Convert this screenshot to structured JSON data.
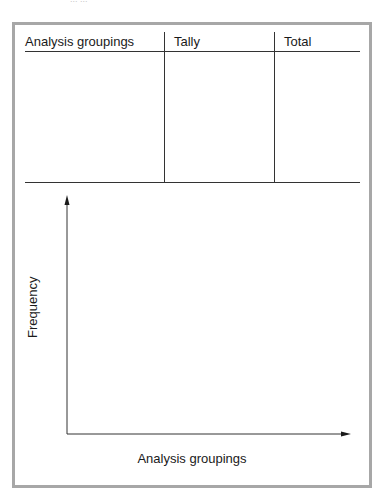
{
  "page": {
    "clipped_caption": "... ..."
  },
  "table": {
    "columns": [
      {
        "label": "Analysis groupings"
      },
      {
        "label": "Tally"
      },
      {
        "label": "Total"
      }
    ],
    "rows": []
  },
  "graph": {
    "y_axis_label": "Frequency",
    "x_axis_label": "Analysis groupings"
  },
  "colors": {
    "frame_border": "#a7a7a7",
    "rule_lines": "#333333",
    "text": "#1a1a1a"
  }
}
